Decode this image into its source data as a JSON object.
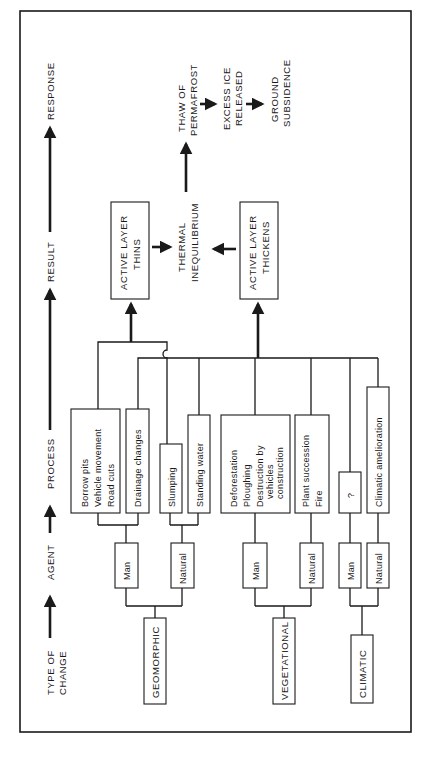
{
  "stages": {
    "type_of_change_1": "TYPE OF",
    "type_of_change_2": "CHANGE",
    "agent": "AGENT",
    "process": "PROCESS",
    "result": "RESULT",
    "response": "RESPONSE"
  },
  "types": {
    "geomorphic": "GEOMORPHIC",
    "vegetational": "VEGETATIONAL",
    "climatic": "CLIMATIC"
  },
  "agents": {
    "man": "Man",
    "natural": "Natural"
  },
  "processes": {
    "geo_man_1": [
      "Borrow pits",
      "Vehicle movement",
      "Road cuts"
    ],
    "geo_man_2": [
      "Drainage changes"
    ],
    "geo_nat_1": [
      "Slumping"
    ],
    "geo_nat_2": [
      "Standing water"
    ],
    "veg_man": [
      "Deforestation",
      "Ploughing",
      "Destruction by",
      "vehicles",
      "construction"
    ],
    "veg_nat": [
      "Plant succession",
      "Fire"
    ],
    "clim_man": [
      "?"
    ],
    "clim_nat": [
      "Climatic amelioration"
    ]
  },
  "results": {
    "thins": [
      "ACTIVE LAYER",
      "THINS"
    ],
    "thickens": [
      "ACTIVE LAYER",
      "THICKENS"
    ],
    "thermal": [
      "THERMAL",
      "INEQUILIBRIUM"
    ]
  },
  "responses": {
    "thaw": [
      "THAW OF",
      "PERMAFROST"
    ],
    "ice": [
      "EXCESS ICE",
      "RELEASED"
    ],
    "ground": [
      "GROUND",
      "SUBSIDENCE"
    ]
  }
}
